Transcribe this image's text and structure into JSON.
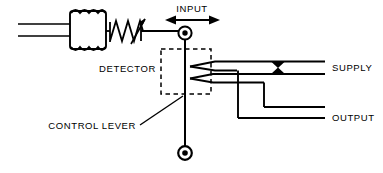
{
  "diagram": {
    "type": "schematic",
    "background_color": "#ffffff",
    "line_color": "#000000",
    "labels": {
      "input": "INPUT",
      "detector": "DETECTOR",
      "control_lever": "CONTROL LEVER",
      "supply": "SUPPLY",
      "output": "OUTPUT"
    },
    "components": {
      "bellows": {
        "name": "bellows",
        "convolutions": 4,
        "x": 68,
        "y": 12,
        "width": 40,
        "height": 36
      },
      "spring": {
        "name": "adjustment-spring",
        "zigzag_peaks": 4,
        "has_adjust_arrow": true,
        "x": 108,
        "y": 30
      },
      "input_arrow": {
        "name": "input-double-arrow",
        "direction": "bidirectional-horizontal",
        "x1": 165,
        "x2": 218,
        "y": 18
      },
      "upper_pivot": {
        "name": "upper-pivot",
        "cx": 185,
        "cy": 33,
        "r_outer": 6.5,
        "r_inner": 2.6
      },
      "lower_pivot": {
        "name": "lower-pivot",
        "cx": 185,
        "cy": 153,
        "r_outer": 6.5,
        "r_inner": 2.6
      },
      "detector_box": {
        "name": "detector-dashed-box",
        "x": 161,
        "y": 49,
        "width": 50,
        "height": 45,
        "dashed": true
      },
      "control_lever": {
        "name": "control-lever-flapper",
        "x": 185,
        "y_top": 33,
        "y_bottom": 153
      },
      "nozzles": {
        "name": "opposed-nozzles",
        "count": 2,
        "tip_x": 190,
        "upper_y": 64,
        "lower_y": 76
      },
      "restriction": {
        "name": "supply-restriction-orifice",
        "cx": 278,
        "cy": 68,
        "symbol": "opposed-triangles"
      }
    },
    "lines": {
      "supply_label_y": 68,
      "output_label_y": 115,
      "right_edge_x": 325
    }
  }
}
